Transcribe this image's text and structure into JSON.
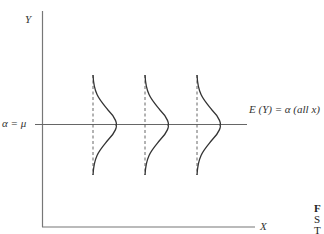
{
  "axes": {
    "y_label": "Y",
    "x_label": "X"
  },
  "reference_line": {
    "left_label": "α = μ",
    "right_label": "E (Y) = α  (all x)"
  },
  "distributions": {
    "count": 3,
    "x_positions_px": [
      93,
      145,
      197
    ],
    "shape": "normal density, identical spread"
  },
  "clipped_caption": {
    "lines": [
      "F",
      "S",
      "T"
    ]
  },
  "colors": {
    "line": "#555555",
    "curve": "#333333",
    "background": "#ffffff"
  }
}
